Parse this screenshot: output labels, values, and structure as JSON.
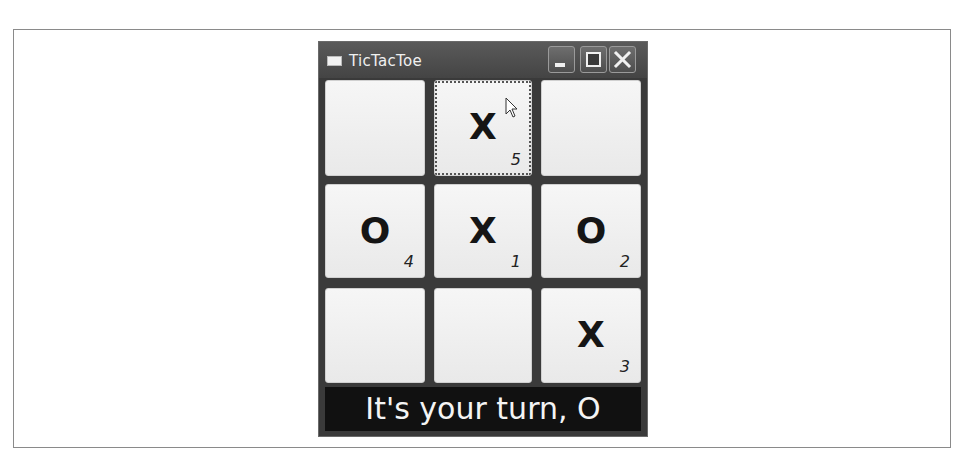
{
  "window": {
    "title": "TicTacToe",
    "controls": [
      "minimize",
      "maximize",
      "close"
    ]
  },
  "board": {
    "cells": [
      {
        "row": 0,
        "col": 0,
        "mark": "",
        "move": ""
      },
      {
        "row": 0,
        "col": 1,
        "mark": "X",
        "move": "5",
        "focused": true
      },
      {
        "row": 0,
        "col": 2,
        "mark": "",
        "move": ""
      },
      {
        "row": 1,
        "col": 0,
        "mark": "O",
        "move": "4"
      },
      {
        "row": 1,
        "col": 1,
        "mark": "X",
        "move": "1"
      },
      {
        "row": 1,
        "col": 2,
        "mark": "O",
        "move": "2"
      },
      {
        "row": 2,
        "col": 0,
        "mark": "",
        "move": ""
      },
      {
        "row": 2,
        "col": 1,
        "mark": "",
        "move": ""
      },
      {
        "row": 2,
        "col": 2,
        "mark": "X",
        "move": "3"
      }
    ]
  },
  "status": {
    "text": "It's your turn, O"
  },
  "colors": {
    "window_frame": "#3a3a3a",
    "cell_bg": "#f2f2f2",
    "status_bg": "#111111",
    "status_text": "#f4f4f4"
  }
}
